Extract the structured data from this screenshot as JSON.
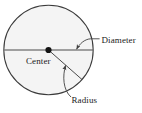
{
  "figure": {
    "type": "geometry-diagram",
    "shape": "circle",
    "colors": {
      "background": "#ffffff",
      "circle_fill": "#f4f4f4",
      "circle_stroke": "#3b3b3b",
      "line_stroke": "#4a4a4a",
      "leader_stroke": "#4a4a4a",
      "center_dot": "#141414",
      "text": "#1a1a1a"
    },
    "geometry": {
      "center_x": 48.5,
      "center_y": 50,
      "radius": 45,
      "diameter_endpoints": [
        [
          4,
          50
        ],
        [
          93,
          50
        ]
      ],
      "radius_endpoints": [
        [
          48.5,
          50
        ],
        [
          82,
          80
        ]
      ],
      "center_dot_radius": 3.1
    },
    "labels": {
      "center": "Center",
      "diameter": "Diameter",
      "radius": "Radius"
    },
    "label_positions": {
      "center": [
        26,
        63
      ],
      "diameter": [
        101,
        43
      ],
      "radius": [
        71,
        103
      ]
    },
    "leaders": {
      "diameter": {
        "from": [
          99,
          39
        ],
        "to": [
          76,
          50
        ],
        "arrow": true
      },
      "radius": {
        "from": [
          70,
          97
        ],
        "to": [
          66,
          64
        ],
        "arrow": true
      }
    }
  }
}
